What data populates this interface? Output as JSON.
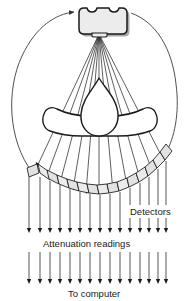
{
  "figure": {
    "labels": {
      "detectors": "Detectors",
      "attenuation": "Attenuation readings",
      "to_computer": "To computer"
    },
    "parts": {
      "source_name": "x-ray-tube",
      "body_name": "patient-cross-section",
      "detector_array_name": "detector-array",
      "gantry_rotation_name": "gantry-rotation-arc"
    },
    "colors": {
      "stroke": "#1a1a1a",
      "fill_light": "#e8e8e8",
      "fill_detector": "#e4e4e4",
      "background": "#ffffff",
      "shadow": "#9a9a9a",
      "arc": "#444444"
    },
    "counts": {
      "detector_segments": 15,
      "beam_rays": 9,
      "reading_arrows": 15
    }
  }
}
